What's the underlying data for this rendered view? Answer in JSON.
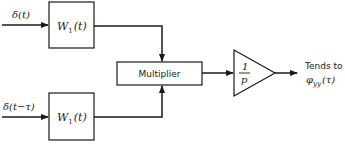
{
  "diagram": {
    "inputs": [
      {
        "label": "δ(t)"
      },
      {
        "label": "δ(t−τ)"
      }
    ],
    "blocks": {
      "filter_top": {
        "label_main": "W",
        "label_sub": "1",
        "label_arg": "(t)"
      },
      "filter_bottom": {
        "label_main": "W",
        "label_sub": "1",
        "label_arg": "(t)"
      },
      "multiplier": {
        "label": "Multiplier"
      },
      "integrator": {
        "numerator": "1",
        "denominator": "p"
      }
    },
    "output": {
      "line1": "Tends to",
      "phi": "φ",
      "phi_sub": "yy",
      "phi_arg": "(τ)"
    },
    "colors": {
      "stroke": "#1a1a1a",
      "background": "#ffffff"
    }
  }
}
